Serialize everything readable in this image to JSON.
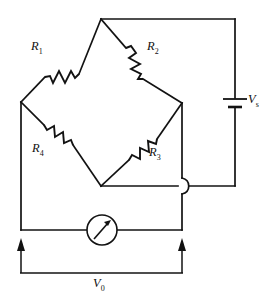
{
  "figure": {
    "name": "wheatstone-bridge-circuit",
    "type": "schematic",
    "background_color": "#ffffff",
    "line_color": "#121212",
    "width": 274,
    "height": 299
  },
  "labels": {
    "r1": "R",
    "r1_sub": "1",
    "r2": "R",
    "r2_sub": "2",
    "r3": "R",
    "r3_sub": "3",
    "r4": "R",
    "r4_sub": "4",
    "vs": "V",
    "vs_sub": "s",
    "v0": "V",
    "v0_sub": "0"
  },
  "components": {
    "resistors": [
      {
        "id": "R1",
        "label": "R1",
        "position": "upper-left-arm"
      },
      {
        "id": "R2",
        "label": "R2",
        "position": "upper-right-arm"
      },
      {
        "id": "R3",
        "label": "R3",
        "position": "lower-right-arm"
      },
      {
        "id": "R4",
        "label": "R4",
        "position": "lower-left-arm"
      }
    ],
    "source": {
      "id": "Vs",
      "label": "Vs",
      "type": "battery",
      "position": "right-side"
    },
    "meter": {
      "id": "meter",
      "type": "galvanometer",
      "position": "bottom-center"
    },
    "output": {
      "id": "V0",
      "label": "V0",
      "type": "voltage-measurement",
      "position": "bottom"
    },
    "crossover": {
      "type": "wire-hop",
      "position": "right-of-bottom-node",
      "connected": false
    }
  },
  "nodes": {
    "top": {
      "x": 101,
      "y": 19
    },
    "left": {
      "x": 21,
      "y": 102
    },
    "right": {
      "x": 182,
      "y": 103
    },
    "bottom": {
      "x": 101,
      "y": 186
    }
  }
}
